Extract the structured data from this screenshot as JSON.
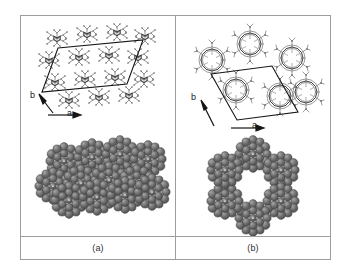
{
  "figure": {
    "panels": [
      {
        "id": "panel-a",
        "caption": "(a)",
        "axis_a_label": "a",
        "axis_b_label": "b",
        "top_view": {
          "representation": "stick",
          "packing": "lamellar rows",
          "unit_cell": "parallelogram"
        },
        "bottom_view": {
          "representation": "space-filling",
          "packing": "close-packed offset rows",
          "cavity": "none"
        }
      },
      {
        "id": "panel-b",
        "caption": "(b)",
        "axis_a_label": "a",
        "axis_b_label": "b",
        "top_view": {
          "representation": "stick",
          "packing": "hexagonal rosette",
          "unit_cell": "parallelogram"
        },
        "bottom_view": {
          "representation": "space-filling",
          "packing": "hexagonal rosette",
          "cavity": "central pore"
        }
      }
    ]
  },
  "colors": {
    "frame": "#9d9d9d",
    "stick_dark": "#4a4a4a",
    "stick_light": "#8e8e8e",
    "cpk_fill": "#6a6a6a",
    "cpk_edge": "#3a3a3a",
    "cpk_highlight": "#9a9a9a",
    "unit_cell_line": "#1a1a1a",
    "background": "#ffffff",
    "caption_text": "#303030"
  }
}
